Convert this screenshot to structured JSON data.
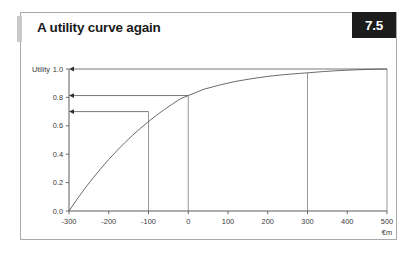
{
  "figure": {
    "title": "A utility curve again",
    "badge": "7.5"
  },
  "chart_data": {
    "type": "line",
    "title": "A utility curve again",
    "xlabel": "€m",
    "ylabel": "Utility",
    "xlim": [
      -300,
      500
    ],
    "ylim": [
      0.0,
      1.0
    ],
    "grid": false,
    "legend": false,
    "x_ticks": [
      -300,
      -200,
      -100,
      0,
      100,
      200,
      300,
      400,
      500
    ],
    "x_tick_labels": [
      "-300",
      "-200",
      "-100",
      "0",
      "100",
      "200",
      "300",
      "400",
      "500"
    ],
    "y_ticks": [
      0.0,
      0.2,
      0.4,
      0.6,
      0.8,
      1.0
    ],
    "y_tick_labels": [
      "0.0",
      "0.2",
      "0.4",
      "0.6",
      "0.8",
      "1.0"
    ],
    "series": [
      {
        "name": "utility curve",
        "x": [
          -300,
          -280,
          -260,
          -240,
          -220,
          -200,
          -180,
          -160,
          -140,
          -120,
          -100,
          -80,
          -60,
          -40,
          -20,
          0,
          40,
          80,
          120,
          160,
          200,
          240,
          280,
          300,
          340,
          380,
          420,
          460,
          500
        ],
        "y": [
          0.0,
          0.082,
          0.159,
          0.231,
          0.299,
          0.363,
          0.423,
          0.48,
          0.533,
          0.583,
          0.63,
          0.674,
          0.715,
          0.753,
          0.79,
          0.813,
          0.858,
          0.888,
          0.913,
          0.932,
          0.948,
          0.96,
          0.969,
          0.973,
          0.982,
          0.989,
          0.994,
          0.998,
          1.0
        ]
      }
    ],
    "drop_lines": [
      {
        "x": -100,
        "y_top": 0.7,
        "label": "drop-line-minus100"
      },
      {
        "x": 0,
        "y_top": 0.813,
        "label": "drop-line-zero"
      },
      {
        "x": 300,
        "y_top": 0.973,
        "label": "drop-line-300"
      },
      {
        "x": 500,
        "y_top": 1.0,
        "label": "drop-line-500"
      }
    ],
    "arrows": [
      {
        "y": 1.0,
        "from_x": 500,
        "to_x": -300,
        "label": "arrow-to-utility-1-0"
      },
      {
        "y": 0.813,
        "from_x": 0,
        "to_x": -300,
        "label": "arrow-to-utility-0-81"
      },
      {
        "y": 0.7,
        "from_x": -100,
        "to_x": -300,
        "label": "arrow-to-utility-0-70"
      }
    ],
    "annotations": []
  }
}
